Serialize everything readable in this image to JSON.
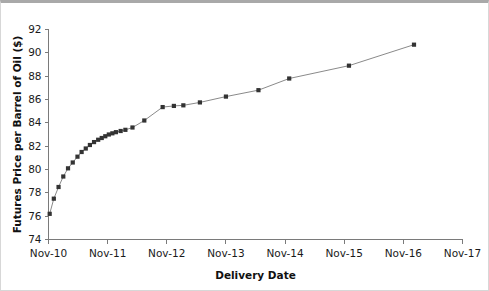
{
  "chart_data": {
    "type": "line",
    "title": "",
    "xlabel": "Delivery Date",
    "ylabel": "Futures Price per Barrel of Oil ($)",
    "xlim": [
      0,
      7
    ],
    "ylim": [
      74,
      92
    ],
    "grid": false,
    "legend": null,
    "marker": "square",
    "marker_color": "#333333",
    "line_color": "#8a8a8a",
    "x_tick_labels": [
      "Nov-10",
      "Nov-11",
      "Nov-12",
      "Nov-13",
      "Nov-14",
      "Nov-15",
      "Nov-16",
      "Nov-17"
    ],
    "x_tick_values": [
      0,
      1,
      2,
      3,
      4,
      5,
      6,
      7
    ],
    "y_tick_labels": [
      "74",
      "76",
      "78",
      "80",
      "82",
      "84",
      "86",
      "88",
      "90",
      "92"
    ],
    "y_tick_values": [
      74,
      76,
      78,
      80,
      82,
      84,
      86,
      88,
      90,
      92
    ],
    "series": [
      {
        "name": "Oil futures curve",
        "x": [
          0.02,
          0.09,
          0.17,
          0.25,
          0.33,
          0.41,
          0.49,
          0.56,
          0.63,
          0.7,
          0.77,
          0.84,
          0.9,
          0.96,
          1.02,
          1.08,
          1.14,
          1.22,
          1.3,
          1.42,
          1.62,
          1.93,
          2.12,
          2.28,
          2.56,
          3.0,
          3.55,
          4.07,
          5.08,
          6.18
        ],
        "y": [
          76.2,
          77.5,
          78.5,
          79.4,
          80.1,
          80.6,
          81.1,
          81.5,
          81.8,
          82.1,
          82.35,
          82.55,
          82.7,
          82.85,
          83.0,
          83.1,
          83.2,
          83.3,
          83.4,
          83.6,
          84.2,
          85.35,
          85.45,
          85.5,
          85.75,
          86.25,
          86.8,
          87.8,
          88.9,
          90.7
        ]
      }
    ]
  }
}
